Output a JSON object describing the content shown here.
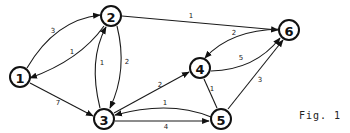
{
  "caption": "Fig. 1",
  "nodes": [
    {
      "id": "1",
      "label": "1",
      "x": 20,
      "y": 77
    },
    {
      "id": "2",
      "label": "2",
      "x": 111,
      "y": 16
    },
    {
      "id": "3",
      "label": "3",
      "x": 104,
      "y": 119
    },
    {
      "id": "4",
      "label": "4",
      "x": 200,
      "y": 68
    },
    {
      "id": "5",
      "label": "5",
      "x": 221,
      "y": 119
    },
    {
      "id": "6",
      "label": "6",
      "x": 289,
      "y": 30
    }
  ],
  "edges": [
    {
      "from": "1",
      "to": "2",
      "weight": "3",
      "directed": true
    },
    {
      "from": "2",
      "to": "1",
      "weight": "1",
      "directed": true
    },
    {
      "from": "1",
      "to": "3",
      "weight": "7",
      "directed": true
    },
    {
      "from": "2",
      "to": "6",
      "weight": "1",
      "directed": true
    },
    {
      "from": "2",
      "to": "3",
      "weight": "2",
      "directed": true
    },
    {
      "from": "3",
      "to": "2",
      "weight": "1",
      "directed": true
    },
    {
      "from": "3",
      "to": "4",
      "weight": "2",
      "directed": true
    },
    {
      "from": "5",
      "to": "3",
      "weight": "1",
      "directed": true
    },
    {
      "from": "3",
      "to": "5",
      "weight": "4",
      "directed": true
    },
    {
      "from": "6",
      "to": "4",
      "weight": "2",
      "directed": true
    },
    {
      "from": "4",
      "to": "6",
      "weight": "5",
      "directed": true
    },
    {
      "from": "4",
      "to": "5",
      "weight": "1",
      "directed": false
    },
    {
      "from": "5",
      "to": "6",
      "weight": "3",
      "directed": true
    }
  ],
  "labels": {
    "n1": "1",
    "n2": "2",
    "n3": "3",
    "n4": "4",
    "n5": "5",
    "n6": "6",
    "e12": "3",
    "e21": "1",
    "e13": "7",
    "e26": "1",
    "e23": "2",
    "e32": "1",
    "e34": "2",
    "e53": "1",
    "e35": "4",
    "e64": "2",
    "e46": "5",
    "e45": "1",
    "e56": "3"
  }
}
